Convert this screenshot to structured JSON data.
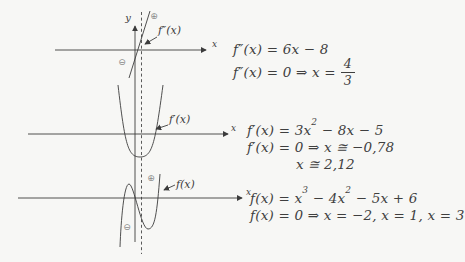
{
  "page": {
    "background": "#f7f7f5",
    "ink": "#3c3c3c",
    "sign_color": "#8a8a8a"
  },
  "diagram": {
    "y_axis_label": "y",
    "x_axis_label": "x",
    "second_derivative_label": "f″(x)",
    "first_derivative_label": "f′(x)",
    "function_label": "f(x)",
    "sign_positive": "⊕",
    "sign_negative": "⊖"
  },
  "equations": {
    "second_derivative": {
      "line1": "f″(x) = 6x − 8",
      "line2_pre": "f″(x) = 0 ⇒ x =",
      "fraction_numerator": "4",
      "fraction_denominator": "3"
    },
    "first_derivative": {
      "line1_pre": "f′(x) = 3x",
      "line1_sup": "2",
      "line1_post": " − 8x − 5",
      "line2": "f′(x) = 0 ⇒ x ≅ −0,78",
      "line3": "x ≅ 2,12"
    },
    "function": {
      "line1_pre": "f(x) = x",
      "line1_sup1": "3",
      "line1_mid": " − 4x",
      "line1_sup2": "2",
      "line1_post": " − 5x + 6",
      "line2": "f(x) = 0 ⇒ x = −2, x = 1, x = 3"
    }
  }
}
